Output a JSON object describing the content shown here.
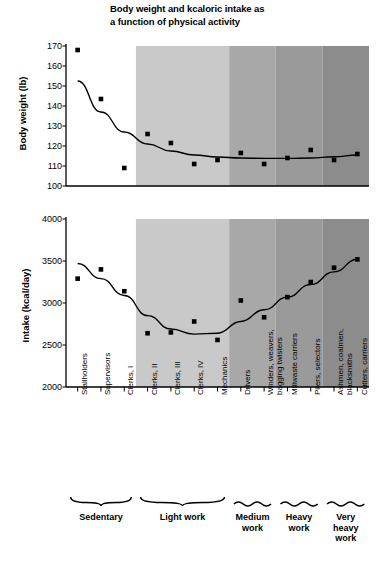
{
  "title": "Body weight and kcaloric intake as a function of physical activity",
  "title_line1": "Body weight and kcaloric intake as",
  "title_line2": "a function of physical activity",
  "axes": {
    "weight_label": "Body weight (lb)",
    "intake_label": "Intake (kcal/day)"
  },
  "categories": [
    "Stallholders",
    "Supervisors",
    "Clerks, I",
    "Clerks, II",
    "Clerks, III",
    "Clerks, IV",
    "Mechanics",
    "Drivers",
    "Winders, weavers, bagging twisters",
    "Millwaste carriers",
    "Pilers, selectors",
    "Ashmen, coalmen, blacksmiths",
    "Cutters, carriers"
  ],
  "category_lines": [
    [
      "Stallholders"
    ],
    [
      "Supervisors"
    ],
    [
      "Clerks, I"
    ],
    [
      "Clerks, II"
    ],
    [
      "Clerks, III"
    ],
    [
      "Clerks, IV"
    ],
    [
      "Mechanics"
    ],
    [
      "Drivers"
    ],
    [
      "Winders, weavers,",
      "bagging twisters"
    ],
    [
      "Millwaste carriers"
    ],
    [
      "Pilers, selectors"
    ],
    [
      "Ashmen, coalmen,",
      "blacksmiths"
    ],
    [
      "Cutters, carriers"
    ]
  ],
  "groups": [
    {
      "label": "Sedentary",
      "lines": [
        "Sedentary"
      ],
      "start": 0,
      "end": 2
    },
    {
      "label": "Light work",
      "lines": [
        "Light work"
      ],
      "start": 3,
      "end": 6
    },
    {
      "label": "Medium work",
      "lines": [
        "Medium",
        "work"
      ],
      "start": 7,
      "end": 8
    },
    {
      "label": "Heavy work",
      "lines": [
        "Heavy",
        "work"
      ],
      "start": 9,
      "end": 10
    },
    {
      "label": "Very heavy work",
      "lines": [
        "Very",
        "heavy",
        "work"
      ],
      "start": 11,
      "end": 12
    }
  ],
  "band_colors": [
    "#ffffff",
    "#c9c9c9",
    "#a8a8a8",
    "#9a9a9a",
    "#8c8c8c"
  ],
  "chart_data": [
    {
      "type": "scatter",
      "title": "Body weight (lb)",
      "xlabel": "",
      "ylabel": "Body weight (lb)",
      "ylim": [
        100,
        170
      ],
      "yticks": [
        100,
        110,
        120,
        130,
        140,
        150,
        160,
        170
      ],
      "grid": false,
      "legend": "none",
      "categories": [
        "Stallholders",
        "Supervisors",
        "Clerks, I",
        "Clerks, II",
        "Clerks, III",
        "Clerks, IV",
        "Mechanics",
        "Drivers",
        "Winders, weavers, bagging twisters",
        "Millwaste carriers",
        "Pilers, selectors",
        "Ashmen, coalmen, blacksmiths",
        "Cutters, carriers"
      ],
      "values": [
        168,
        143.5,
        109,
        126,
        121.5,
        111,
        113,
        116.5,
        111,
        114,
        118,
        113,
        116
      ],
      "trend": {
        "name": "fitted curve",
        "values": [
          152.5,
          137,
          127,
          121,
          117.5,
          115.5,
          114.5,
          114,
          113.8,
          113.8,
          114,
          114.6,
          115.5
        ]
      }
    },
    {
      "type": "scatter",
      "title": "Intake (kcal/day)",
      "xlabel": "",
      "ylabel": "Intake (kcal/day)",
      "ylim": [
        2000,
        4000
      ],
      "yticks": [
        2000,
        2500,
        3000,
        3500,
        4000
      ],
      "grid": false,
      "legend": "none",
      "categories": [
        "Stallholders",
        "Supervisors",
        "Clerks, I",
        "Clerks, II",
        "Clerks, III",
        "Clerks, IV",
        "Mechanics",
        "Drivers",
        "Winders, weavers, bagging twisters",
        "Millwaste carriers",
        "Pilers, selectors",
        "Ashmen, coalmen, blacksmiths",
        "Cutters, carriers"
      ],
      "values": [
        3290,
        3400,
        3140,
        2640,
        2650,
        2780,
        2560,
        3030,
        2830,
        3070,
        3250,
        3420,
        3520
      ],
      "trend": {
        "name": "fitted curve",
        "values": [
          3470,
          3290,
          3090,
          2850,
          2690,
          2630,
          2640,
          2780,
          2920,
          3070,
          3220,
          3370,
          3520
        ]
      }
    }
  ]
}
